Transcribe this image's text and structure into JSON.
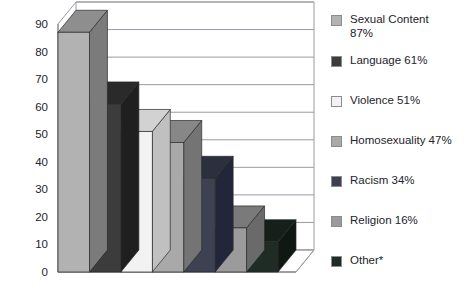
{
  "chart_data": {
    "type": "bar",
    "title": "",
    "subtitle": "",
    "xlabel": "",
    "ylabel": "",
    "ylim": [
      0,
      90
    ],
    "ytick_step": 10,
    "ytick_labels": [
      "90",
      "80",
      "70",
      "60",
      "50",
      "40",
      "30",
      "20",
      "10",
      "0"
    ],
    "grid": true,
    "grid_axis": "y",
    "legend_position": "right",
    "three_d": true,
    "categories": [
      "Sexual Content",
      "Language",
      "Violence",
      "Homosexuality",
      "Racism",
      "Religion",
      "Other*"
    ],
    "values": [
      87,
      61,
      51,
      47,
      34,
      16,
      11
    ],
    "series": [
      {
        "name": "Percent of respondents",
        "values": [
          87,
          61,
          51,
          47,
          34,
          16,
          11
        ]
      }
    ],
    "bar_colors": [
      "#b2b2b2",
      "#3c3c3c",
      "#f2f2f2",
      "#a9a9a9",
      "#3e4152",
      "#9b9b9b",
      "#1f2b25"
    ],
    "bar_top_colors": [
      "#8e8e8e",
      "#2a2a2a",
      "#d2d2d2",
      "#878787",
      "#2c2f3e",
      "#7a7a7a",
      "#16201b"
    ],
    "bar_side_colors": [
      "#7b7b7b",
      "#1f1f1f",
      "#c0c0c0",
      "#747474",
      "#23263a",
      "#6a6a6a",
      "#101814"
    ],
    "annotations": [
      "*"
    ]
  },
  "legend": {
    "items": [
      {
        "label": "Sexual Content\n87%",
        "color": "#b2b2b2",
        "value": 87
      },
      {
        "label": "Language 61%",
        "color": "#3c3c3c",
        "value": 61
      },
      {
        "label": "Violence 51%",
        "color": "#f2f2f2",
        "value": 51
      },
      {
        "label": "Homosexuality 47%",
        "color": "#a9a9a9",
        "value": 47
      },
      {
        "label": "Racism 34%",
        "color": "#3e4152",
        "value": 34
      },
      {
        "label": "Religion 16%",
        "color": "#9b9b9b",
        "value": 16
      },
      {
        "label": "Other*",
        "color": "#1f2b25",
        "value": 11
      }
    ]
  },
  "axis": {
    "y_labels": [
      "90",
      "80",
      "70",
      "60",
      "50",
      "40",
      "30",
      "20",
      "10",
      "0"
    ]
  },
  "colors": {
    "background": "#ffffff",
    "axis_line": "#6e6e78",
    "grid_line": "#9a9aa4",
    "text": "#23232b"
  }
}
